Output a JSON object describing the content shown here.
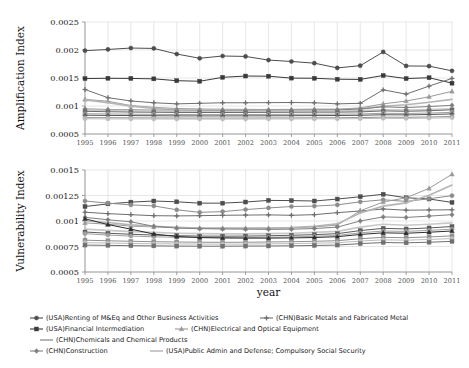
{
  "figure": {
    "width": 469,
    "height": 368,
    "background": "#ffffff",
    "xlabel": "year"
  },
  "chart_data": [
    {
      "type": "line",
      "panel": "top",
      "title": "",
      "xlabel": "",
      "ylabel": "Amplification Index",
      "x": [
        1995,
        1996,
        1997,
        1998,
        1999,
        2000,
        2001,
        2002,
        2003,
        2004,
        2005,
        2006,
        2007,
        2008,
        2009,
        2010,
        2011
      ],
      "xlim": [
        1995,
        2011
      ],
      "ylim": [
        0.0005,
        0.0025
      ],
      "yticks": [
        "0.0005",
        "0.001",
        "0.0015",
        "0.002",
        "0.0025"
      ],
      "ytick_values": [
        0.0005,
        0.001,
        0.0015,
        0.002,
        0.0025
      ],
      "xtick_labels": [
        "1995",
        "1996",
        "1997",
        "1998",
        "1999",
        "2000",
        "2001",
        "2002",
        "2003",
        "2004",
        "2005",
        "2006",
        "2007",
        "2008",
        "2009",
        "2010",
        "2011"
      ],
      "grid": true,
      "legend_position": "below",
      "series": [
        {
          "name": "(USA)Renting of M&Eq and Other Business Activities",
          "color": "#4d4d4d",
          "marker": "circle",
          "values": [
            0.001988,
            0.00201,
            0.002035,
            0.002028,
            0.001928,
            0.001852,
            0.001893,
            0.001885,
            0.00182,
            0.001795,
            0.001765,
            0.00168,
            0.00172,
            0.001965,
            0.001715,
            0.001712,
            0.001628
          ]
        },
        {
          "name": "(USA)Financial Intermediation",
          "color": "#3a3a3a",
          "marker": "square",
          "values": [
            0.00149,
            0.001495,
            0.001492,
            0.001485,
            0.001452,
            0.001442,
            0.001512,
            0.001535,
            0.001532,
            0.001498,
            0.001495,
            0.001478,
            0.001475,
            0.001545,
            0.00149,
            0.001505,
            0.001408
          ]
        },
        {
          "name": "(CHN)Basic Metals and Fabricated Metal",
          "color": "#6e6e6e",
          "marker": "plus",
          "values": [
            0.001295,
            0.001148,
            0.00109,
            0.001058,
            0.001038,
            0.001048,
            0.001058,
            0.001058,
            0.00106,
            0.001062,
            0.001058,
            0.001038,
            0.001048,
            0.001288,
            0.001212,
            0.001355,
            0.001492
          ]
        },
        {
          "name": "(CHN)Electrical and Optical Equipment",
          "color": "#9a9a9a",
          "marker": "triangle",
          "values": [
            0.001118,
            0.001085,
            0.001008,
            0.000975,
            0.000955,
            0.000948,
            0.000942,
            0.00094,
            0.000938,
            0.00094,
            0.000945,
            0.000945,
            0.000965,
            0.001038,
            0.001088,
            0.001165,
            0.001262
          ]
        },
        {
          "name": "(CHN)Chemicals and Chemical Products",
          "color": "#b5b5b5",
          "marker": "none",
          "values": [
            0.001108,
            0.00106,
            0.000998,
            0.000958,
            0.000932,
            0.000926,
            0.000922,
            0.00092,
            0.00092,
            0.000922,
            0.000926,
            0.00093,
            0.000948,
            0.000995,
            0.001022,
            0.001068,
            0.001118
          ]
        },
        {
          "name": "(CHN)Construction",
          "color": "#808080",
          "marker": "diamond",
          "values": [
            0.000948,
            0.000938,
            0.000932,
            0.000926,
            0.000922,
            0.00092,
            0.00092,
            0.000921,
            0.000922,
            0.000925,
            0.000928,
            0.00093,
            0.000948,
            0.000985,
            0.000972,
            0.00099,
            0.001012
          ]
        },
        {
          "name": "(USA)Public Admin and Defense; Compulsory Social Security",
          "color": "#c8c8c8",
          "marker": "none",
          "values": [
            0.000928,
            0.000922,
            0.000918,
            0.000912,
            0.000908,
            0.000905,
            0.000905,
            0.000906,
            0.000908,
            0.00091,
            0.000912,
            0.000912,
            0.000918,
            0.000932,
            0.000928,
            0.000938,
            0.000952
          ]
        },
        {
          "name": "series-h",
          "color": "#6b6b6b",
          "marker": "square",
          "values": [
            0.000905,
            0.000898,
            0.000892,
            0.000888,
            0.000885,
            0.000884,
            0.000884,
            0.000885,
            0.000886,
            0.000888,
            0.00089,
            0.00089,
            0.000895,
            0.000912,
            0.000905,
            0.000915,
            0.000932
          ]
        },
        {
          "name": "series-i",
          "color": "#a0a0a0",
          "marker": "circle",
          "values": [
            0.000862,
            0.000858,
            0.000854,
            0.00085,
            0.000848,
            0.000847,
            0.000847,
            0.000848,
            0.000849,
            0.000851,
            0.000853,
            0.000854,
            0.000858,
            0.00087,
            0.000866,
            0.000874,
            0.000886
          ]
        },
        {
          "name": "series-j",
          "color": "#555555",
          "marker": "plus",
          "values": [
            0.000835,
            0.000832,
            0.000829,
            0.000826,
            0.000824,
            0.000823,
            0.000823,
            0.000824,
            0.000825,
            0.000827,
            0.000829,
            0.00083,
            0.000834,
            0.000844,
            0.000841,
            0.000848,
            0.000858
          ]
        },
        {
          "name": "series-k",
          "color": "#8f8f8f",
          "marker": "circle",
          "values": [
            0.000792,
            0.00079,
            0.000788,
            0.000786,
            0.000785,
            0.000784,
            0.000784,
            0.000785,
            0.000786,
            0.000787,
            0.000789,
            0.00079,
            0.000793,
            0.000801,
            0.000798,
            0.000804,
            0.000812
          ]
        },
        {
          "name": "series-l",
          "color": "#bdbdbd",
          "marker": "circle",
          "values": [
            0.000772,
            0.00077,
            0.000769,
            0.000768,
            0.000767,
            0.000766,
            0.000766,
            0.000767,
            0.000768,
            0.000769,
            0.00077,
            0.000771,
            0.000774,
            0.00078,
            0.000778,
            0.000783,
            0.00079
          ]
        }
      ]
    },
    {
      "type": "line",
      "panel": "bottom",
      "title": "",
      "xlabel": "year",
      "ylabel": "Vulnerability Index",
      "x": [
        1995,
        1996,
        1997,
        1998,
        1999,
        2000,
        2001,
        2002,
        2003,
        2004,
        2005,
        2006,
        2007,
        2008,
        2009,
        2010,
        2011
      ],
      "xlim": [
        1995,
        2011
      ],
      "ylim": [
        0.0005,
        0.0015
      ],
      "yticks": [
        "0.0005",
        "0.00075",
        "0.001",
        "0.00125",
        "0.0015"
      ],
      "ytick_values": [
        0.0005,
        0.00075,
        0.001,
        0.00125,
        0.0015
      ],
      "xtick_labels": [
        "1995",
        "1996",
        "1997",
        "1998",
        "1999",
        "2000",
        "2001",
        "2002",
        "2003",
        "2004",
        "2005",
        "2006",
        "2007",
        "2008",
        "2009",
        "2010",
        "2011"
      ],
      "grid": true,
      "legend_position": "below",
      "series": [
        {
          "name": "(USA)Renting of M&Eq and Other Business Activities",
          "color": "#4d4d4d",
          "marker": "square",
          "values": [
            0.001142,
            0.001168,
            0.001185,
            0.001196,
            0.001188,
            0.001175,
            0.001175,
            0.001186,
            0.001202,
            0.0012,
            0.001196,
            0.001215,
            0.001238,
            0.001262,
            0.001228,
            0.001216,
            0.001182
          ]
        },
        {
          "name": "(USA)Financial Intermediation",
          "color": "#8c8c8c",
          "marker": "circle",
          "values": [
            0.001196,
            0.001175,
            0.001158,
            0.001148,
            0.00111,
            0.001085,
            0.001092,
            0.001112,
            0.001128,
            0.001142,
            0.001146,
            0.001158,
            0.001188,
            0.001208,
            0.001192,
            0.001218,
            0.001248
          ]
        },
        {
          "name": "(CHN)Basic Metals and Fabricated Metal",
          "color": "#6e6e6e",
          "marker": "plus",
          "values": [
            0.001086,
            0.001072,
            0.001062,
            0.001052,
            0.00105,
            0.001052,
            0.001056,
            0.001058,
            0.00106,
            0.001056,
            0.001062,
            0.001082,
            0.001098,
            0.001118,
            0.001106,
            0.001108,
            0.00111
          ]
        },
        {
          "name": "(CHN)Electrical and Optical Equipment",
          "color": "#9a9a9a",
          "marker": "triangle",
          "values": [
            0.000982,
            0.000968,
            0.00095,
            0.000942,
            0.000936,
            0.00093,
            0.000928,
            0.000928,
            0.00093,
            0.000932,
            0.000942,
            0.00096,
            0.0011,
            0.001186,
            0.001228,
            0.00132,
            0.001458
          ]
        },
        {
          "name": "(CHN)Chemicals and Chemical Products",
          "color": "#b5b5b5",
          "marker": "none",
          "values": [
            0.001002,
            0.000985,
            0.000962,
            0.000948,
            0.000938,
            0.000932,
            0.00093,
            0.00093,
            0.000932,
            0.000936,
            0.000948,
            0.000972,
            0.001078,
            0.001146,
            0.001178,
            0.001252,
            0.001352
          ]
        },
        {
          "name": "(CHN)Construction",
          "color": "#808080",
          "marker": "diamond",
          "values": [
            0.001036,
            0.001012,
            0.000992,
            0.000948,
            0.00093,
            0.000925,
            0.000922,
            0.00092,
            0.000918,
            0.00092,
            0.000926,
            0.00094,
            0.001,
            0.00104,
            0.001035,
            0.001048,
            0.001062
          ]
        },
        {
          "name": "(USA)Public Admin and Defense; Compulsory Social Security",
          "color": "#c8c8c8",
          "marker": "none",
          "values": [
            0.00092,
            0.000908,
            0.000896,
            0.000888,
            0.00088,
            0.000876,
            0.000874,
            0.000874,
            0.000876,
            0.00088,
            0.000888,
            0.000898,
            0.00094,
            0.000968,
            0.000958,
            0.000968,
            0.000982
          ]
        },
        {
          "name": "series-h",
          "color": "#5a5a5a",
          "marker": "square",
          "values": [
            0.000892,
            0.00088,
            0.00087,
            0.000862,
            0.000856,
            0.000852,
            0.000851,
            0.000852,
            0.000855,
            0.00086,
            0.000866,
            0.000876,
            0.000906,
            0.000928,
            0.000922,
            0.000932,
            0.000946
          ]
        },
        {
          "name": "series-i",
          "color": "#a0a0a0",
          "marker": "circle",
          "values": [
            0.000876,
            0.000862,
            0.000852,
            0.000845,
            0.00084,
            0.000837,
            0.000836,
            0.000837,
            0.00084,
            0.000844,
            0.00085,
            0.000858,
            0.000884,
            0.000902,
            0.000898,
            0.000908,
            0.00092
          ]
        },
        {
          "name": "series-j",
          "color": "#2e2e2e",
          "marker": "triangle",
          "values": [
            0.001022,
            0.000965,
            0.00092,
            0.000872,
            0.000848,
            0.000838,
            0.000834,
            0.000832,
            0.000832,
            0.000834,
            0.000838,
            0.000846,
            0.000868,
            0.000884,
            0.00088,
            0.00089,
            0.000902
          ]
        },
        {
          "name": "series-k",
          "color": "#8f8f8f",
          "marker": "square",
          "values": [
            0.000812,
            0.000806,
            0.000801,
            0.000797,
            0.000794,
            0.000792,
            0.000791,
            0.000792,
            0.000794,
            0.000797,
            0.000801,
            0.000807,
            0.000826,
            0.00084,
            0.000836,
            0.000844,
            0.000854
          ]
        },
        {
          "name": "series-l",
          "color": "#bdbdbd",
          "marker": "circle",
          "values": [
            0.000788,
            0.000784,
            0.00078,
            0.000777,
            0.000775,
            0.000774,
            0.000773,
            0.000774,
            0.000776,
            0.000778,
            0.000782,
            0.000787,
            0.000803,
            0.000815,
            0.000812,
            0.000819,
            0.000828
          ]
        },
        {
          "name": "series-m",
          "color": "#707070",
          "marker": "square",
          "values": [
            0.000764,
            0.000761,
            0.000758,
            0.000756,
            0.000754,
            0.000753,
            0.000753,
            0.000754,
            0.000755,
            0.000757,
            0.00076,
            0.000764,
            0.000778,
            0.000789,
            0.000786,
            0.000792,
            0.0008
          ]
        }
      ]
    }
  ],
  "legend": {
    "items": [
      {
        "label": "(USA)Renting of M&Eq and Other Business Activities",
        "color": "#4d4d4d",
        "marker": "circle",
        "row": 0,
        "col": 0
      },
      {
        "label": "(CHN)Basic Metals and Fabricated Metal",
        "color": "#6e6e6e",
        "marker": "plus",
        "row": 0,
        "col": 1
      },
      {
        "label": "(USA)Financial Intermediation",
        "color": "#3a3a3a",
        "marker": "square",
        "row": 1,
        "col": 0
      },
      {
        "label": "(CHN)Electrical and Optical Equipment",
        "color": "#9a9a9a",
        "marker": "triangle",
        "row": 1,
        "col": 1
      },
      {
        "label": "(CHN)Chemicals and Chemical Products",
        "color": "#b5b5b5",
        "marker": "none",
        "row": 2,
        "col": 0
      },
      {
        "label": "(CHN)Construction",
        "color": "#808080",
        "marker": "diamond",
        "row": 3,
        "col": 0
      },
      {
        "label": "(USA)Public Admin and Defense; Compulsory Social Security",
        "color": "#c8c8c8",
        "marker": "none",
        "row": 3,
        "col": 1
      }
    ]
  }
}
